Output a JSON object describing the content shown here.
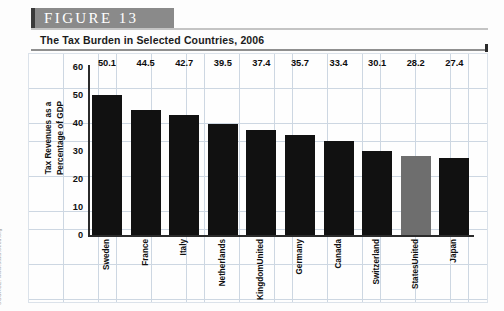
{
  "figure": {
    "banner_label": "FIGURE  13",
    "subtitle": "The Tax Burden in Selected Countries, 2006",
    "source": "SOURCE: www.stats.oecd.org"
  },
  "chart_data": {
    "type": "bar",
    "title": "The Tax Burden in Selected Countries, 2006",
    "xlabel": "",
    "ylabel": "Tax Revenues as a Percentage of GDP",
    "ylabel_lines": [
      "Tax Revenues as a",
      "Percentage of GDP"
    ],
    "ylim": [
      0,
      60
    ],
    "yticks": [
      60,
      50,
      40,
      30,
      20,
      10,
      0
    ],
    "grid": true,
    "legend": "none",
    "highlight_category": "United States",
    "highlight_color": "#6e6e6e",
    "bar_color": "#111111",
    "categories": [
      "Sweden",
      "France",
      "Italy",
      "Netherlands",
      "United Kingdom",
      "Germany",
      "Canada",
      "Switzerland",
      "United States",
      "Japan"
    ],
    "category_lines": [
      [
        "Sweden"
      ],
      [
        "France"
      ],
      [
        "Italy"
      ],
      [
        "Netherlands"
      ],
      [
        "United",
        "Kingdom"
      ],
      [
        "Germany"
      ],
      [
        "Canada"
      ],
      [
        "Switzerland"
      ],
      [
        "United",
        "States"
      ],
      [
        "Japan"
      ]
    ],
    "values": [
      50.1,
      44.5,
      42.7,
      39.5,
      37.4,
      35.7,
      33.4,
      30.1,
      28.2,
      27.4
    ],
    "value_labels": [
      "50.1",
      "44.5",
      "42.7",
      "39.5",
      "37.4",
      "35.7",
      "33.4",
      "30.1",
      "28.2",
      "27.4"
    ]
  }
}
